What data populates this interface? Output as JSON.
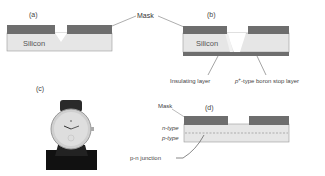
{
  "figure": {
    "panels": {
      "a": {
        "label": "(a)",
        "material": "Silicon"
      },
      "b": {
        "label": "(b)",
        "material": "Silicon"
      },
      "c": {
        "label": "(c)",
        "image": "wristwatch-photo"
      },
      "d": {
        "label": "(d)"
      }
    },
    "annotations": {
      "mask_shared": "Mask",
      "insulating_layer": "Insulating layer",
      "boron_stop_prefix": "p",
      "boron_stop_sup": "+",
      "boron_stop_suffix": "-type boron stop layer",
      "mask_d": "Mask",
      "n_type": "n-type",
      "p_type": "p-type",
      "pn_junction": "p-n junction"
    },
    "colors": {
      "mask": "#6e6e6e",
      "silicon": "#e6e6e6",
      "outline": "#888888",
      "leader": "#666666"
    }
  }
}
